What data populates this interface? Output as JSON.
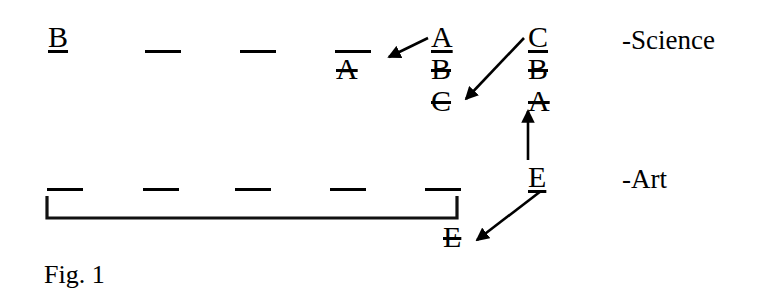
{
  "figure": {
    "caption": "Fig. 1",
    "background_color": "#ffffff",
    "ink_color": "#000000",
    "width": 771,
    "height": 305
  },
  "rows": [
    {
      "id": "science-row",
      "label": "-Science",
      "label_x": 622,
      "label_y": 27,
      "blanks": [
        {
          "name": "science-blank-1",
          "x": 145,
          "y": 50,
          "w": 36
        },
        {
          "name": "science-blank-2",
          "x": 240,
          "y": 50,
          "w": 36
        },
        {
          "name": "science-blank-3",
          "x": 335,
          "y": 50,
          "w": 36
        }
      ]
    },
    {
      "id": "art-row",
      "label": "-Art",
      "label_x": 622,
      "label_y": 166,
      "blanks": [
        {
          "name": "art-blank-1",
          "x": 47,
          "y": 188,
          "w": 36
        },
        {
          "name": "art-blank-2",
          "x": 143,
          "y": 188,
          "w": 36
        },
        {
          "name": "art-blank-3",
          "x": 235,
          "y": 188,
          "w": 36
        },
        {
          "name": "art-blank-4",
          "x": 330,
          "y": 188,
          "w": 36
        },
        {
          "name": "art-blank-5",
          "x": 425,
          "y": 188,
          "w": 36
        }
      ]
    }
  ],
  "tokens": [
    {
      "name": "token-B-filled",
      "text": "B",
      "x": 48,
      "y": 22,
      "style": "underlined"
    },
    {
      "name": "token-A-crossed",
      "text": "A",
      "x": 336,
      "y": 54,
      "style": "struck"
    },
    {
      "name": "token-A-selected",
      "text": "A",
      "x": 431,
      "y": 22,
      "style": "underlined"
    },
    {
      "name": "token-B-crossed",
      "text": "B",
      "x": 431,
      "y": 54,
      "style": "struck"
    },
    {
      "name": "token-C-crossed",
      "text": "C",
      "x": 431,
      "y": 86,
      "style": "struck"
    },
    {
      "name": "token-C-selected",
      "text": "C",
      "x": 528,
      "y": 22,
      "style": "underlined"
    },
    {
      "name": "token-B-crossed-2",
      "text": "B",
      "x": 528,
      "y": 54,
      "style": "struck"
    },
    {
      "name": "token-A-crossed-2",
      "text": "A",
      "x": 528,
      "y": 86,
      "style": "struck"
    },
    {
      "name": "token-E-selected",
      "text": "E",
      "x": 528,
      "y": 162,
      "style": "underlined"
    },
    {
      "name": "token-E-crossed",
      "text": "E",
      "x": 443,
      "y": 222,
      "style": "struck"
    }
  ],
  "arrows": [
    {
      "name": "arrow-A-to-blank",
      "x1": 428,
      "y1": 38,
      "x2": 389,
      "y2": 57
    },
    {
      "name": "arrow-C-to-C",
      "x1": 524,
      "y1": 38,
      "x2": 466,
      "y2": 99
    },
    {
      "name": "arrow-E-up-to-A",
      "x1": 528,
      "y1": 160,
      "x2": 528,
      "y2": 111
    },
    {
      "name": "arrow-E-to-E",
      "x1": 541,
      "y1": 191,
      "x2": 477,
      "y2": 240
    }
  ],
  "bracket": {
    "name": "art-group-bracket",
    "left_x": 47,
    "right_x": 457,
    "top_y": 196,
    "bottom_y": 218
  },
  "caption_position": {
    "x": 44,
    "y": 262
  }
}
